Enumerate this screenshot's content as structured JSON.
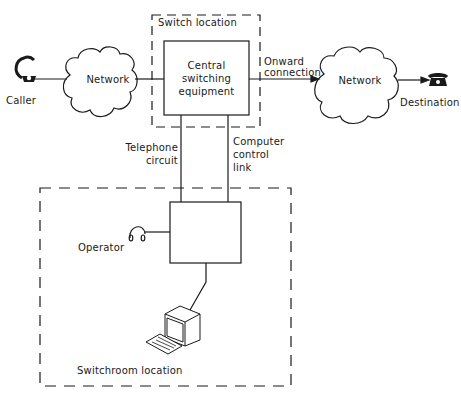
{
  "diagram": {
    "caller": {
      "label": "Caller",
      "icon": "telephone-handset-icon"
    },
    "left_network": {
      "label": "Network"
    },
    "switch_location": {
      "label": "Switch location",
      "equipment": {
        "line1": "Central",
        "line2": "switching",
        "line3": "equipment"
      }
    },
    "onward_connection": {
      "line1": "Onward",
      "line2": "connection"
    },
    "right_network": {
      "label": "Network"
    },
    "destination": {
      "label": "Destination",
      "icon": "telephone-icon"
    },
    "telephone_circuit": {
      "line1": "Telephone",
      "line2": "circuit"
    },
    "computer_control_link": {
      "line1": "Computer",
      "line2": "control",
      "line3": "link"
    },
    "switchroom": {
      "label": "Switchroom location",
      "operator": {
        "label": "Operator",
        "icon": "headset-icon"
      },
      "terminal": {
        "icon": "computer-terminal-icon"
      }
    },
    "colors": {
      "stroke": "#1a1a1a",
      "background": "#ffffff"
    }
  }
}
